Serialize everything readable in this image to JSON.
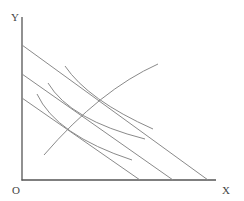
{
  "diagram": {
    "type": "indifference-curve-budget-line",
    "labels": {
      "y_axis": "Y",
      "x_axis": "X",
      "origin": "O"
    },
    "budget_lines": [
      {
        "name": "budget-line-1"
      },
      {
        "name": "budget-line-2"
      },
      {
        "name": "budget-line-3"
      }
    ],
    "indifference_curves": [
      {
        "name": "indifference-curve-1"
      },
      {
        "name": "indifference-curve-2"
      },
      {
        "name": "indifference-curve-3"
      }
    ],
    "expansion_path": {
      "name": "income-consumption-curve"
    },
    "colors": {
      "axis": "#555555",
      "lines": "#8a8a8a",
      "text": "#444444",
      "background": "#ffffff"
    }
  }
}
